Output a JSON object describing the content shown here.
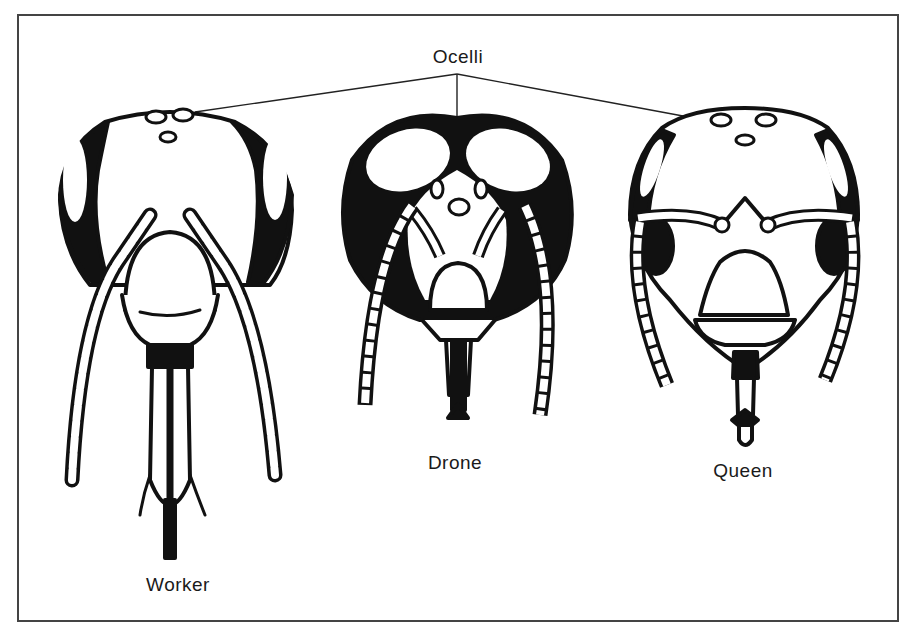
{
  "diagram": {
    "title_label": "Ocelli",
    "heads": [
      {
        "id": "worker",
        "label": "Worker"
      },
      {
        "id": "drone",
        "label": "Drone"
      },
      {
        "id": "queen",
        "label": "Queen"
      }
    ],
    "colors": {
      "ink": "#111111",
      "frame": "#444444",
      "background": "#ffffff"
    }
  }
}
